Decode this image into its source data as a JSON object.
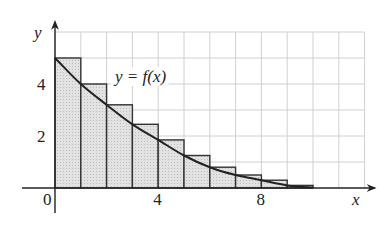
{
  "chart_data": {
    "type": "bar",
    "title": "",
    "xlabel": "x",
    "ylabel": "y",
    "curve_label": "y = f(x)",
    "origin_label": "0",
    "x_ticks": [
      4,
      8
    ],
    "y_ticks": [
      2,
      4
    ],
    "xlim": [
      -1.5,
      12
    ],
    "ylim": [
      -1.2,
      6
    ],
    "grid": true,
    "bar_width": 1,
    "categories": [
      0,
      1,
      2,
      3,
      4,
      5,
      6,
      7,
      8,
      9
    ],
    "values": [
      5.0,
      4.0,
      3.2,
      2.45,
      1.85,
      1.25,
      0.8,
      0.5,
      0.3,
      0.1
    ],
    "curve": {
      "name": "y = f(x)",
      "x": [
        0,
        1,
        2,
        3,
        4,
        5,
        6,
        7,
        8,
        9,
        10
      ],
      "y": [
        5.0,
        4.0,
        3.2,
        2.45,
        1.85,
        1.25,
        0.8,
        0.5,
        0.3,
        0.1,
        0.02
      ]
    },
    "colors": {
      "bar_fill": "#d9d9d9",
      "bar_stroke": "#333333",
      "grid": "#d0d0d0",
      "curve": "#222222",
      "axis": "#222222"
    }
  }
}
